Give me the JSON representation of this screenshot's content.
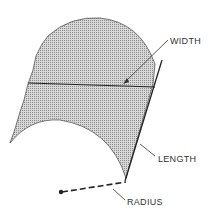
{
  "diagram": {
    "labels": {
      "width": "WIDTH",
      "length": "LENGTH",
      "radius": "RADIUS"
    },
    "colors": {
      "fill": "#bdbdbd",
      "stroke": "#222222",
      "text": "#333333"
    }
  }
}
